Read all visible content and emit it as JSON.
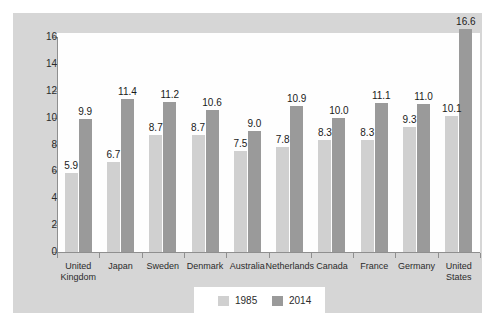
{
  "chart_data": {
    "type": "bar",
    "title": "",
    "subtitle": "",
    "xlabel": "",
    "ylabel": "",
    "ylim": [
      0,
      16
    ],
    "ytick_values": [
      0,
      2,
      4,
      6,
      8,
      10,
      12,
      14,
      16
    ],
    "ytick_labels": [
      "0",
      "2",
      "4",
      "6",
      "8",
      "10",
      "12",
      "14",
      "16"
    ],
    "grid": false,
    "legend_position": "bottom-center",
    "categories": [
      "United Kingdom",
      "Japan",
      "Sweden",
      "Denmark",
      "Australia",
      "Netherlands",
      "Canada",
      "France",
      "Germany",
      "United States"
    ],
    "series": [
      {
        "name": "1985",
        "color": "#d0d0d0",
        "values": [
          5.9,
          6.7,
          8.7,
          8.7,
          7.5,
          7.8,
          8.3,
          8.3,
          9.3,
          10.1
        ],
        "value_labels": [
          "5.9",
          "6.7",
          "8.7",
          "8.7",
          "7.5",
          "7.8",
          "8.3",
          "8.3",
          "9.3",
          "10.1"
        ]
      },
      {
        "name": "2014",
        "color": "#9a9a9a",
        "values": [
          9.9,
          11.4,
          11.2,
          10.6,
          9.0,
          10.9,
          10.0,
          11.1,
          11.0,
          16.6
        ],
        "value_labels": [
          "9.9",
          "11.4",
          "11.2",
          "10.6",
          "9.0",
          "10.9",
          "10.0",
          "11.1",
          "11.0",
          "16.6"
        ]
      }
    ],
    "colors": {
      "panel_background": "#d6d6d6",
      "plot_background": "#fefefe",
      "axis": "#8f8f8f",
      "series_1985": "#d0d0d0",
      "series_2014": "#9a9a9a",
      "text": "#2b2b2b"
    }
  }
}
